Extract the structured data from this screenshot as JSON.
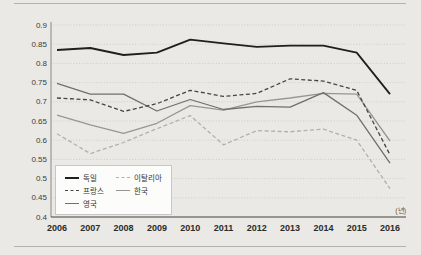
{
  "page": {
    "background_color": "#eae9e5",
    "rule_color": "#b3b2ae"
  },
  "chart_data": {
    "type": "line",
    "x": [
      2006,
      2007,
      2008,
      2009,
      2010,
      2011,
      2012,
      2013,
      2014,
      2015,
      2016
    ],
    "xtick_labels": [
      "2006",
      "2007",
      "2008",
      "2009",
      "2010",
      "2011",
      "2012",
      "2013",
      "2014",
      "2015",
      "2016"
    ],
    "yticks": [
      "0.9",
      "0.85",
      "0.8",
      "0.75",
      "0.7",
      "0.65",
      "0.6",
      "0.55",
      "0.5",
      "0.45",
      "0.4"
    ],
    "ylim": [
      0.4,
      0.9
    ],
    "xaxis_unit": "(년)",
    "grid": "horizontal-dotted",
    "legend_position": "bottom-left-box",
    "series": [
      {
        "id": "germany",
        "name": "독일",
        "color": "#1f1f1d",
        "dashed": false,
        "width": 1.8,
        "values": [
          0.835,
          0.84,
          0.822,
          0.828,
          0.862,
          0.852,
          0.843,
          0.846,
          0.846,
          0.828,
          0.72
        ]
      },
      {
        "id": "france",
        "name": "프랑스",
        "color": "#454543",
        "dashed": true,
        "width": 1.3,
        "values": [
          0.71,
          0.705,
          0.675,
          0.695,
          0.73,
          0.714,
          0.722,
          0.76,
          0.754,
          0.73,
          0.562
        ]
      },
      {
        "id": "uk",
        "name": "영국",
        "color": "#6f6f6d",
        "dashed": false,
        "width": 1.3,
        "values": [
          0.748,
          0.72,
          0.72,
          0.676,
          0.706,
          0.68,
          0.688,
          0.686,
          0.724,
          0.665,
          0.54
        ]
      },
      {
        "id": "italy",
        "name": "이탈리아",
        "color": "#b1b0ac",
        "dashed": true,
        "width": 1.3,
        "values": [
          0.617,
          0.565,
          0.594,
          0.63,
          0.664,
          0.588,
          0.625,
          0.622,
          0.629,
          0.6,
          0.474
        ]
      },
      {
        "id": "korea",
        "name": "한국",
        "color": "#98978f",
        "dashed": false,
        "width": 1.3,
        "values": [
          0.665,
          0.64,
          0.618,
          0.644,
          0.69,
          0.678,
          0.7,
          0.71,
          0.722,
          0.72,
          0.598
        ]
      }
    ],
    "draw_order": [
      3,
      4,
      2,
      1,
      0
    ],
    "legend_columns": [
      [
        0,
        1,
        2
      ],
      [
        3,
        4
      ]
    ]
  }
}
